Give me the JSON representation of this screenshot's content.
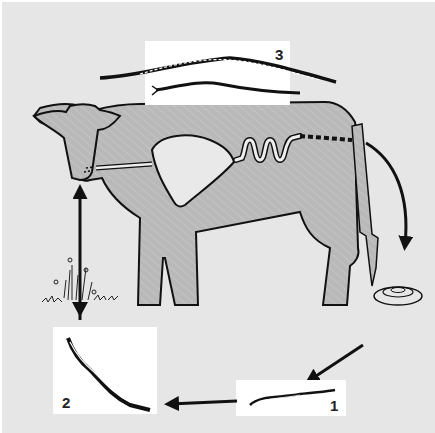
{
  "diagram": {
    "colors": {
      "background": "#e6e6e6",
      "cow_fill": "#b9b9b9",
      "outline": "#111111",
      "panel": "#ffffff",
      "organ_fill": "#e9e9e9"
    },
    "stages": [
      {
        "number": "1",
        "description": "free-living first-stage larva hatched from egg in dung"
      },
      {
        "number": "2",
        "description": "infective larva migrating onto pasture"
      },
      {
        "number": "3",
        "description": "adult worms (female and male) in the host intestine"
      }
    ],
    "elements": {
      "host": "cow",
      "organs": [
        "oesophagus",
        "rumen/stomach",
        "small intestine",
        "large intestine"
      ],
      "dung": "dung pat",
      "pasture": "grass with flowers"
    },
    "flow": [
      "Adult worms in intestine → eggs passed in dung",
      "Dung pat → stage 1 larva",
      "Stage 1 larva → stage 2 larva",
      "Stage 2 larva → pasture grass",
      "Grass ingested → cow mouth"
    ]
  }
}
